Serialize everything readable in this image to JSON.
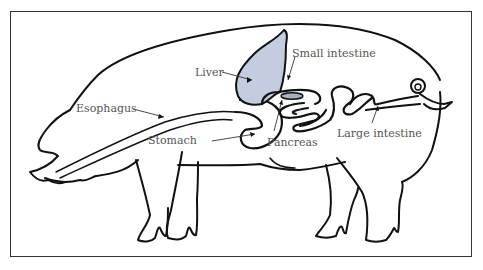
{
  "diagram": {
    "colors": {
      "outline": "#111111",
      "liver_fill": "#c4cde0",
      "pancreas_fill": "#a7b0c4",
      "label_text": "#555555",
      "frame": "#333333"
    },
    "labels": {
      "liver": "Liver",
      "esophagus": "Esophagus",
      "small_intestine": "Small intestine",
      "stomach": "Stomach",
      "pancreas": "Pancreas",
      "large_intestine": "Large intestine"
    }
  }
}
